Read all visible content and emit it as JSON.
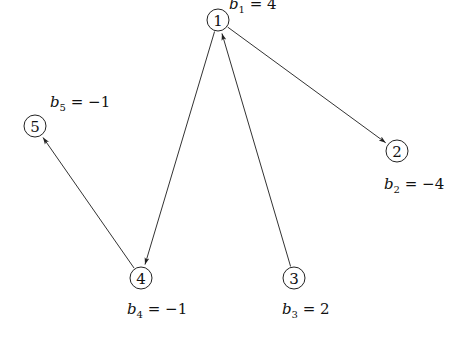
{
  "diagram": {
    "type": "directed-graph",
    "nodes": [
      {
        "id": "1",
        "label": "1",
        "x": 218,
        "y": 20,
        "supply_var": "b",
        "supply_sub": "1",
        "supply_eq": " = 4",
        "label_x": 229,
        "label_y": 9
      },
      {
        "id": "2",
        "label": "2",
        "x": 397,
        "y": 151,
        "supply_var": "b",
        "supply_sub": "2",
        "supply_eq": " = −4",
        "label_x": 384,
        "label_y": 189
      },
      {
        "id": "3",
        "label": "3",
        "x": 294,
        "y": 278,
        "supply_var": "b",
        "supply_sub": "3",
        "supply_eq": " = 2",
        "label_x": 282,
        "label_y": 314
      },
      {
        "id": "4",
        "label": "4",
        "x": 141,
        "y": 278,
        "supply_var": "b",
        "supply_sub": "4",
        "supply_eq": " = −1",
        "label_x": 127,
        "label_y": 314
      },
      {
        "id": "5",
        "label": "5",
        "x": 35,
        "y": 126,
        "supply_var": "b",
        "supply_sub": "5",
        "supply_eq": " = −1",
        "label_x": 50,
        "label_y": 107
      }
    ],
    "edges": [
      {
        "from": "1",
        "to": "2"
      },
      {
        "from": "1",
        "to": "4"
      },
      {
        "from": "3",
        "to": "1"
      },
      {
        "from": "4",
        "to": "5"
      }
    ],
    "node_radius": 11,
    "colors": {
      "stroke": "#222222",
      "edge": "#333333",
      "background": "#ffffff"
    }
  }
}
